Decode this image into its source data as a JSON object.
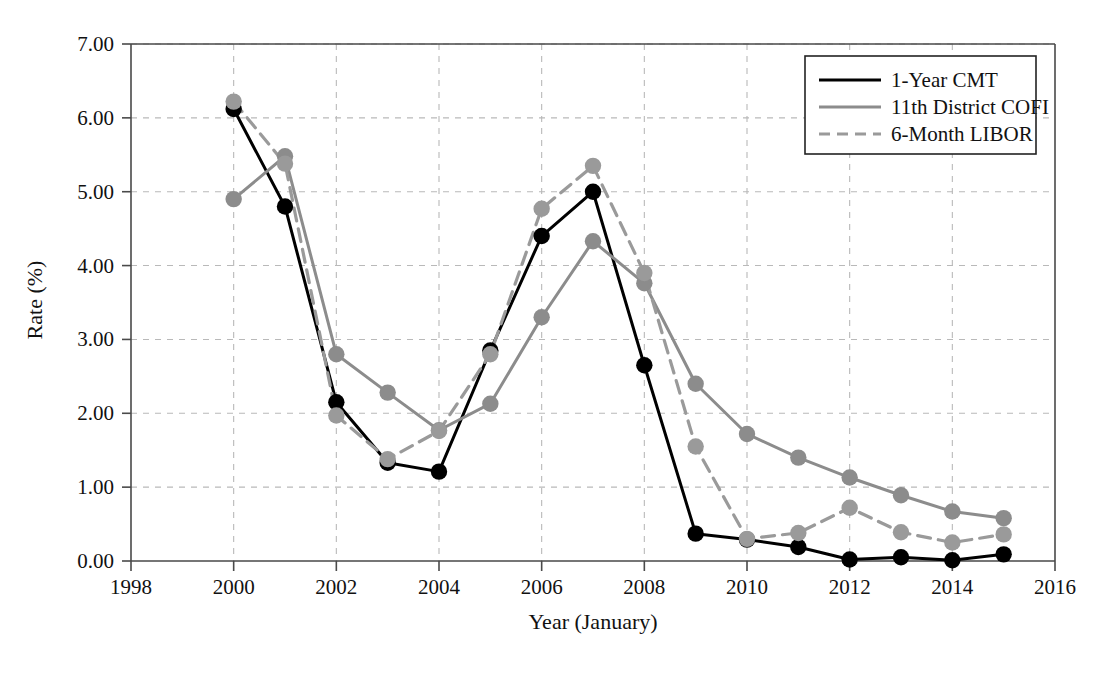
{
  "chart_data": {
    "type": "line",
    "title": "",
    "xlabel": "Year (January)",
    "ylabel": "Rate (%)",
    "xlim": [
      1998,
      2016
    ],
    "ylim": [
      0.0,
      7.0
    ],
    "xticks": [
      1998,
      2000,
      2002,
      2004,
      2006,
      2008,
      2010,
      2012,
      2014,
      2016
    ],
    "xtick_labels": [
      "1998",
      "2000",
      "2002",
      "2004",
      "2006",
      "2008",
      "2010",
      "2012",
      "2014",
      "2016"
    ],
    "yticks": [
      0.0,
      1.0,
      2.0,
      3.0,
      4.0,
      5.0,
      6.0,
      7.0
    ],
    "ytick_labels": [
      "0.00",
      "1.00",
      "2.00",
      "3.00",
      "4.00",
      "5.00",
      "6.00",
      "7.00"
    ],
    "grid": true,
    "legend_position": "top-right",
    "x": [
      2000,
      2001,
      2002,
      2003,
      2004,
      2005,
      2006,
      2007,
      2008,
      2009,
      2010,
      2011,
      2012,
      2013,
      2014,
      2015
    ],
    "series": [
      {
        "name": "1-Year CMT",
        "color": "#000000",
        "style": "solid",
        "marker": "circle",
        "values": [
          6.12,
          4.8,
          2.15,
          1.33,
          1.21,
          2.85,
          4.4,
          5.0,
          2.65,
          0.37,
          0.29,
          0.19,
          0.02,
          0.05,
          0.01,
          0.09
        ]
      },
      {
        "name": "11th District COFI",
        "color": "#8c8c8c",
        "style": "solid",
        "marker": "circle",
        "values": [
          4.9,
          5.48,
          2.8,
          2.28,
          1.77,
          2.13,
          3.3,
          4.33,
          3.76,
          2.4,
          1.72,
          1.4,
          1.13,
          0.89,
          0.67,
          0.58
        ]
      },
      {
        "name": "6-Month LIBOR",
        "color": "#9a9a9a",
        "style": "dashed",
        "marker": "circle",
        "values": [
          6.22,
          5.38,
          1.97,
          1.38,
          1.76,
          2.8,
          4.77,
          5.35,
          3.9,
          1.55,
          0.3,
          0.38,
          0.72,
          0.39,
          0.25,
          0.36
        ]
      }
    ]
  }
}
